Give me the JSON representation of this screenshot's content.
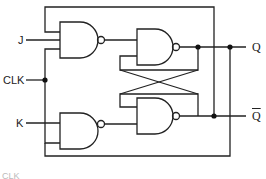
{
  "diagram": {
    "type": "JK flip-flop logic diagram",
    "inputs": {
      "j": "J",
      "clk": "CLK",
      "k": "K"
    },
    "outputs": {
      "q": "Q",
      "q_bar": "Q"
    },
    "footer_label": "CLK",
    "gates": [
      {
        "id": "nand-j",
        "type": "NAND",
        "inputs": [
          "Q_bar feedback",
          "J",
          "CLK"
        ]
      },
      {
        "id": "nand-k",
        "type": "NAND",
        "inputs": [
          "CLK",
          "K",
          "Q feedback"
        ]
      },
      {
        "id": "nand-q",
        "type": "NAND",
        "inputs": [
          "nand-j output",
          "nand-qbar output"
        ]
      },
      {
        "id": "nand-qbar",
        "type": "NAND",
        "inputs": [
          "nand-q output",
          "nand-k output"
        ]
      }
    ],
    "colors": {
      "line": "#222222",
      "background": "#ffffff"
    }
  }
}
